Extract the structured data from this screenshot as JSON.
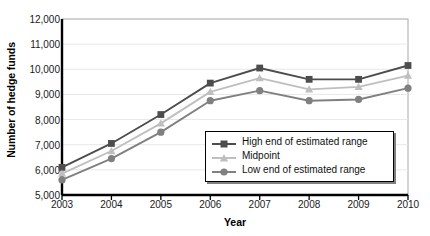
{
  "chart_data": {
    "type": "line",
    "title": "",
    "xlabel": "Year",
    "ylabel": "Number of hedge funds",
    "categories": [
      "2003",
      "2004",
      "2005",
      "2006",
      "2007",
      "2008",
      "2009",
      "2010"
    ],
    "x": [
      2003,
      2004,
      2005,
      2006,
      2007,
      2008,
      2009,
      2010
    ],
    "xlim": [
      2003,
      2010
    ],
    "ylim": [
      5000,
      12000
    ],
    "yticks": [
      5000,
      6000,
      7000,
      8000,
      9000,
      10000,
      11000,
      12000
    ],
    "ytick_labels": [
      "5,000",
      "6,000",
      "7,000",
      "8,000",
      "9,000",
      "10,000",
      "11,000",
      "12,000"
    ],
    "grid": "horizontal",
    "legend_position": "inside-lower-right",
    "series": [
      {
        "name": "High end of estimated range",
        "color": "#4d4d4d",
        "marker": "square",
        "values": [
          6100,
          7050,
          8200,
          9450,
          10050,
          9600,
          9600,
          10150
        ]
      },
      {
        "name": "Midpoint",
        "color": "#bfbfbf",
        "marker": "triangle",
        "values": [
          5850,
          6750,
          7850,
          9100,
          9650,
          9200,
          9300,
          9750
        ]
      },
      {
        "name": "Low end of estimated range",
        "color": "#808080",
        "marker": "circle",
        "values": [
          5600,
          6450,
          7500,
          8750,
          9150,
          8750,
          8800,
          9250
        ]
      }
    ]
  },
  "axes": {
    "y_title": "Number of hedge funds",
    "x_title": "Year"
  },
  "legend": {
    "items": [
      {
        "label": "High end of estimated range"
      },
      {
        "label": "Midpoint"
      },
      {
        "label": "Low end of estimated range"
      }
    ]
  },
  "colors": {
    "high": "#4d4d4d",
    "midpoint": "#bfbfbf",
    "low": "#808080",
    "axis": "#000000",
    "grid": "#e8e8e8",
    "plot_border": "#a6a6a6",
    "background": "#ffffff"
  }
}
